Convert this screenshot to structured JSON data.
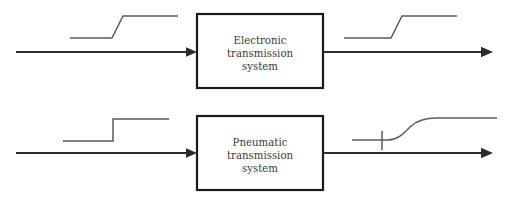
{
  "figure": {
    "type": "block-diagram",
    "background_color": "#ffffff",
    "line_color": "#2b2b2b",
    "trace_color": "#5b5b5b",
    "box_stroke_color": "#1a1a1a",
    "text_color": "#3a3a3a"
  },
  "rows": [
    {
      "id": "electronic-row",
      "block": {
        "label_lines": [
          "Electronic",
          "transmission",
          "system"
        ],
        "line1": "Electronic",
        "line2": "transmission",
        "line3": "system",
        "x": 197,
        "y": 14,
        "width": 126,
        "height": 74
      },
      "input_signal": {
        "name": "ramped-step-input",
        "description": "step with finite rise time",
        "points": "70,38 112,38 123,16 178,16"
      },
      "output_signal": {
        "name": "ramped-step-output",
        "description": "step with finite rise time",
        "points": "344,38 391,38 402,16 457,16"
      },
      "input_arrow": {
        "x1": 16,
        "y1": 52,
        "x2": 197,
        "y2": 52
      },
      "output_arrow": {
        "x1": 323,
        "y1": 52,
        "x2": 487,
        "y2": 52
      },
      "has_lag_tick": false
    },
    {
      "id": "pneumatic-row",
      "block": {
        "label_lines": [
          "Pneumatic",
          "transmission",
          "system"
        ],
        "line1": "Pneumatic",
        "line2": "transmission",
        "line3": "system",
        "x": 197,
        "y": 116,
        "width": 126,
        "height": 74
      },
      "input_signal": {
        "name": "ideal-step-input",
        "description": "instantaneous step",
        "points": "63,141 113,141 113,119 169,119"
      },
      "output_signal": {
        "name": "exponential-lag-output",
        "description": "first-order exponential rise showing transmission lag",
        "path": "M 352,140 L 388,140 C 398,140 403,134 410,127 C 417,120 425,118 437,118 L 497,118"
      },
      "lag_tick": {
        "x": 382,
        "y1": 131,
        "y2": 150
      },
      "input_arrow": {
        "x1": 16,
        "y1": 153,
        "x2": 197,
        "y2": 153
      },
      "output_arrow": {
        "x1": 323,
        "y1": 153,
        "x2": 487,
        "y2": 153
      },
      "has_lag_tick": true
    }
  ]
}
